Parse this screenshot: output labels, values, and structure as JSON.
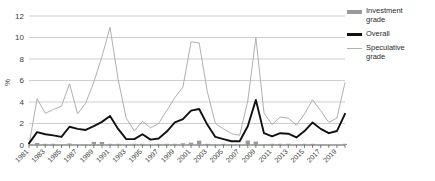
{
  "chart_data": {
    "type": "line",
    "title": "",
    "subtitle": "",
    "xlabel": "",
    "ylabel": "%",
    "ylim": [
      0,
      12
    ],
    "yticks": [
      0,
      2,
      4,
      6,
      8,
      10,
      12
    ],
    "xlim": [
      1981,
      2020
    ],
    "grid": true,
    "legend_position": "right",
    "x": [
      1981,
      1982,
      1983,
      1984,
      1985,
      1986,
      1987,
      1988,
      1989,
      1990,
      1991,
      1992,
      1993,
      1994,
      1995,
      1996,
      1997,
      1998,
      1999,
      2000,
      2001,
      2002,
      2003,
      2004,
      2005,
      2006,
      2007,
      2008,
      2009,
      2010,
      2011,
      2012,
      2013,
      2014,
      2015,
      2016,
      2017,
      2018,
      2019,
      2020
    ],
    "xtick_labels": [
      "1981",
      "1983",
      "1985",
      "1987",
      "1989",
      "1991",
      "1993",
      "1995",
      "1997",
      "1999",
      "2001",
      "2003",
      "2005",
      "2007",
      "2009",
      "2011",
      "2013",
      "2015",
      "2017",
      "2019"
    ],
    "series": [
      {
        "name": "Investment grade",
        "render": "bar",
        "color": "#9a9a9a",
        "values": [
          0.0,
          0.19,
          0.09,
          0.09,
          0.0,
          0.14,
          0.0,
          0.0,
          0.29,
          0.28,
          0.06,
          0.05,
          0.0,
          0.06,
          0.07,
          0.0,
          0.06,
          0.04,
          0.04,
          0.16,
          0.22,
          0.4,
          0.1,
          0.0,
          0.03,
          0.0,
          0.0,
          0.42,
          0.32,
          0.0,
          0.06,
          0.03,
          0.11,
          0.0,
          0.07,
          0.06,
          0.0,
          0.0,
          0.0,
          0.05
        ]
      },
      {
        "name": "Overall",
        "render": "line",
        "color": "#111111",
        "values": [
          0.15,
          1.2,
          1.0,
          0.9,
          0.75,
          1.7,
          1.5,
          1.4,
          1.75,
          2.15,
          2.7,
          1.5,
          0.55,
          0.55,
          1.0,
          0.5,
          0.6,
          1.25,
          2.1,
          2.4,
          3.2,
          3.35,
          1.9,
          0.75,
          0.55,
          0.35,
          0.35,
          1.75,
          4.2,
          1.1,
          0.8,
          1.1,
          1.05,
          0.7,
          1.3,
          2.1,
          1.5,
          1.1,
          1.3,
          2.9
        ]
      },
      {
        "name": "Speculative grade",
        "render": "line",
        "color": "#b0b0b0",
        "values": [
          0.0,
          4.3,
          2.95,
          3.3,
          3.6,
          5.7,
          2.9,
          3.9,
          5.85,
          8.2,
          10.95,
          6.1,
          2.5,
          1.3,
          2.2,
          1.6,
          2.0,
          3.2,
          4.4,
          5.4,
          9.6,
          9.5,
          5.0,
          2.0,
          1.5,
          1.05,
          0.9,
          4.1,
          10.0,
          3.0,
          1.9,
          2.6,
          2.5,
          1.85,
          2.9,
          4.2,
          3.2,
          2.1,
          2.5,
          5.8
        ]
      }
    ]
  },
  "legend": {
    "items": [
      {
        "label_line1": "Investment",
        "label_line2": "grade",
        "marker": "bar-swatch"
      },
      {
        "label_line1": "Overall",
        "label_line2": "",
        "marker": "thick-line-swatch"
      },
      {
        "label_line1": "Speculative",
        "label_line2": "grade",
        "marker": "thin-line-swatch"
      }
    ]
  },
  "axes": {
    "y_title": "%"
  }
}
